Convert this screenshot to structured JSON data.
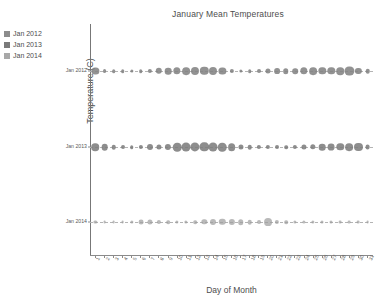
{
  "chart_data": {
    "type": "scatter",
    "title": "January Mean Temperatures",
    "xlabel": "Day of Month",
    "ylabel": "Temperature (C)",
    "grid": false,
    "legend_position": "upper-left-outside",
    "marker_size_encodes": "Temperature (C)",
    "x": [
      1,
      2,
      3,
      4,
      5,
      6,
      7,
      8,
      9,
      10,
      11,
      12,
      13,
      14,
      15,
      16,
      17,
      18,
      19,
      20,
      21,
      22,
      23,
      24,
      25,
      26,
      27,
      28,
      29,
      30,
      31
    ],
    "xtick_labels": [
      "1",
      "2",
      "3",
      "4",
      "5",
      "6",
      "7",
      "8",
      "9",
      "10",
      "11",
      "12",
      "13",
      "14",
      "15",
      "16",
      "17",
      "18",
      "19",
      "20",
      "21",
      "22",
      "23",
      "24",
      "25",
      "26",
      "27",
      "28",
      "29",
      "30",
      "31"
    ],
    "ytick_labels": [
      "Jan 2012",
      "Jan 2013",
      "Jan 2014"
    ],
    "ylim": [
      "Jan 2014",
      "Jan 2012"
    ],
    "xlim": [
      0.4,
      31.6
    ],
    "series": [
      {
        "name": "Jan 2012",
        "color": "#808080",
        "values": [
          4.0,
          1.2,
          1.0,
          1.0,
          0.8,
          1.0,
          1.4,
          3.2,
          3.4,
          4.2,
          4.6,
          5.0,
          5.4,
          5.0,
          4.0,
          1.4,
          0.8,
          1.0,
          1.2,
          2.0,
          2.6,
          2.4,
          2.4,
          4.2,
          4.6,
          4.2,
          4.2,
          4.4,
          6.4,
          3.0,
          1.6
        ]
      },
      {
        "name": "Jan 2013",
        "color": "#7a7a7a",
        "values": [
          4.4,
          3.4,
          1.6,
          1.2,
          1.0,
          1.4,
          2.8,
          2.0,
          3.0,
          5.6,
          6.2,
          6.6,
          6.8,
          6.2,
          5.6,
          4.6,
          2.0,
          1.6,
          1.4,
          1.4,
          1.2,
          1.0,
          1.4,
          2.0,
          2.2,
          3.4,
          3.6,
          4.2,
          4.6,
          5.0,
          1.8
        ]
      },
      {
        "name": "Jan 2014",
        "color": "#9e9e9e",
        "values": [
          0.8,
          0.6,
          0.6,
          0.6,
          0.8,
          1.8,
          2.0,
          1.4,
          1.0,
          0.8,
          0.8,
          1.0,
          2.2,
          2.8,
          3.2,
          3.0,
          2.4,
          1.6,
          1.2,
          4.8,
          1.4,
          1.0,
          0.8,
          0.8,
          0.8,
          0.7,
          0.7,
          0.6,
          0.6,
          0.6,
          0.6
        ]
      }
    ]
  },
  "legend": {
    "items": [
      {
        "label": "Jan 2012",
        "color": "#8c8c8c"
      },
      {
        "label": "Jan 2013",
        "color": "#7a7a7a"
      },
      {
        "label": "Jan 2014",
        "color": "#a8a8a8"
      }
    ]
  },
  "colors": {
    "axis": "#8a8a8a",
    "text": "#4d4d4d",
    "connector": "#b4b4b4",
    "background": "#ffffff"
  }
}
